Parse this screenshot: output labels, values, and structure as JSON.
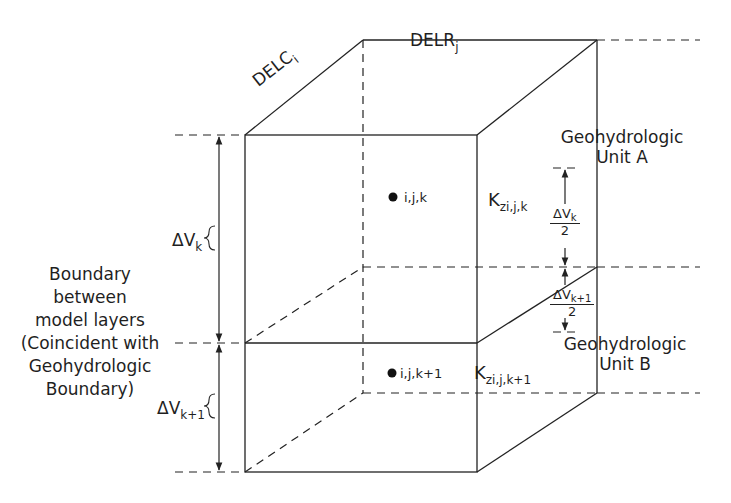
{
  "diagram": {
    "type": "finite-difference-cell-block",
    "labels": {
      "delr": {
        "base": "DELR",
        "sub": "j"
      },
      "delc": {
        "base": "DELC",
        "sub": "i"
      },
      "unit_a": {
        "line1": "Geohydrologic",
        "line2": "Unit A"
      },
      "unit_b": {
        "line1": "Geohydrologic",
        "line2": "Unit B"
      },
      "node_upper": "i,j,k",
      "node_lower": "i,j,k+1",
      "k_upper": {
        "base": "K",
        "sub": "zi,j,k"
      },
      "k_lower": {
        "base": "K",
        "sub": "zi,j,k+1"
      },
      "dv_k": {
        "base": "ΔV",
        "sub": "k"
      },
      "dv_k1": {
        "base": "ΔV",
        "sub": "k+1"
      },
      "half_dv_k": {
        "num_base": "ΔV",
        "num_sub": "k",
        "den": "2"
      },
      "half_dv_k1": {
        "num_base": "ΔV",
        "num_sub": "k+1",
        "den": "2"
      },
      "boundary": {
        "line1": "Boundary",
        "line2": "between",
        "line3": "model layers",
        "line4": "(Coincident with",
        "line5": "Geohydrologic",
        "line6": "Boundary)"
      }
    },
    "colors": {
      "line": "#222222",
      "background": "#ffffff"
    }
  }
}
